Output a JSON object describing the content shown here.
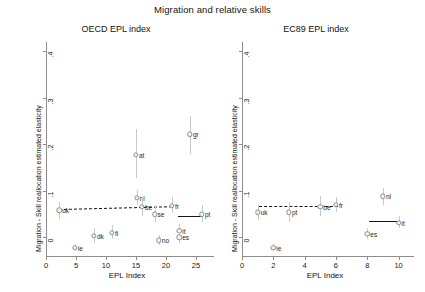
{
  "figure": {
    "title": "Migration and relative skills",
    "y_axis_title": "Migration - Skill reallocation estimated elasticity",
    "x_axis_title": "EPL Index"
  },
  "chart_data": [
    {
      "type": "scatter",
      "title": "OECD EPL index",
      "xlabel": "EPL Index",
      "ylabel": "Migration - Skill reallocation estimated elasticity",
      "xlim": [
        0,
        27
      ],
      "ylim": [
        -0.04,
        0.42
      ],
      "xticks": [
        0,
        5,
        10,
        15,
        20,
        25
      ],
      "xticklabels": [
        "0",
        "5",
        "10",
        "15",
        "20",
        "25"
      ],
      "yticks": [
        0,
        0.1,
        0.2,
        0.3,
        0.4
      ],
      "yticklabels": [
        "0",
        ".1",
        ".2",
        ".3",
        ".4"
      ],
      "grid": false,
      "legend": "none",
      "points": [
        {
          "label": "uk",
          "x": 2.2,
          "y": 0.058,
          "lo": 0.04,
          "hi": 0.076,
          "label_side": "right"
        },
        {
          "label": "ie",
          "x": 4.8,
          "y": -0.022,
          "lo": -0.03,
          "hi": -0.014,
          "label_side": "right"
        },
        {
          "label": "dk",
          "x": 8.0,
          "y": 0.004,
          "lo": -0.012,
          "hi": 0.02,
          "label_side": "right"
        },
        {
          "label": "fi",
          "x": 11.0,
          "y": 0.01,
          "lo": -0.004,
          "hi": 0.026,
          "label_side": "right"
        },
        {
          "label": "at",
          "x": 15.0,
          "y": 0.178,
          "lo": 0.128,
          "hi": 0.232,
          "label_side": "right"
        },
        {
          "label": "nl",
          "x": 15.1,
          "y": 0.085,
          "lo": 0.07,
          "hi": 0.102,
          "label_side": "right"
        },
        {
          "label": "be",
          "x": 16.0,
          "y": 0.066,
          "lo": 0.046,
          "hi": 0.086,
          "label_side": "right"
        },
        {
          "label": "se",
          "x": 18.1,
          "y": 0.05,
          "lo": 0.034,
          "hi": 0.07,
          "label_side": "right"
        },
        {
          "label": "no",
          "x": 18.8,
          "y": -0.006,
          "lo": -0.016,
          "hi": 0.006,
          "label_side": "right"
        },
        {
          "label": "fr",
          "x": 21.0,
          "y": 0.068,
          "lo": 0.052,
          "hi": 0.086,
          "label_side": "right"
        },
        {
          "label": "it",
          "x": 22.2,
          "y": 0.014,
          "lo": 0.002,
          "hi": 0.028,
          "label_side": "right"
        },
        {
          "label": "es",
          "x": 22.2,
          "y": 0.0,
          "lo": -0.012,
          "hi": 0.012,
          "label_side": "right"
        },
        {
          "label": "gr",
          "x": 24.0,
          "y": 0.222,
          "lo": 0.18,
          "hi": 0.262,
          "label_side": "right"
        },
        {
          "label": "pt",
          "x": 26.0,
          "y": 0.05,
          "lo": 0.032,
          "hi": 0.07,
          "label_side": "right"
        }
      ],
      "fit_lines": [
        {
          "style": "dashed",
          "x0": 2.2,
          "x1": 21.0,
          "y0": 0.062,
          "y1": 0.068
        },
        {
          "style": "solid",
          "x0": 22.0,
          "x1": 26.2,
          "y0": 0.046,
          "y1": 0.046
        }
      ]
    },
    {
      "type": "scatter",
      "title": "EC89 EPL index",
      "xlabel": "EPL Index",
      "ylabel": "Migration - Skill reallocation estimated elasticity",
      "xlim": [
        0,
        10.6
      ],
      "ylim": [
        -0.04,
        0.42
      ],
      "xticks": [
        0,
        2,
        4,
        6,
        8,
        10
      ],
      "xticklabels": [
        "0",
        "2",
        "4",
        "6",
        "8",
        "10"
      ],
      "yticks": [
        0,
        0.1,
        0.2,
        0.3,
        0.4
      ],
      "yticklabels": [
        "0",
        ".1",
        ".2",
        ".3",
        ".4"
      ],
      "grid": false,
      "legend": "none",
      "points": [
        {
          "label": "uk",
          "x": 1.0,
          "y": 0.054,
          "lo": 0.038,
          "hi": 0.07,
          "label_side": "right"
        },
        {
          "label": "ie",
          "x": 2.0,
          "y": -0.022,
          "lo": -0.03,
          "hi": -0.014,
          "label_side": "right"
        },
        {
          "label": "pt",
          "x": 3.0,
          "y": 0.054,
          "lo": 0.034,
          "hi": 0.076,
          "label_side": "right"
        },
        {
          "label": "be",
          "x": 5.0,
          "y": 0.066,
          "lo": 0.046,
          "hi": 0.09,
          "label_side": "right"
        },
        {
          "label": "fr",
          "x": 6.0,
          "y": 0.07,
          "lo": 0.054,
          "hi": 0.086,
          "label_side": "right"
        },
        {
          "label": "es",
          "x": 8.0,
          "y": 0.008,
          "lo": -0.004,
          "hi": 0.02,
          "label_side": "right"
        },
        {
          "label": "nl",
          "x": 9.0,
          "y": 0.088,
          "lo": 0.07,
          "hi": 0.106,
          "label_side": "right"
        },
        {
          "label": "it",
          "x": 10.0,
          "y": 0.032,
          "lo": 0.02,
          "hi": 0.046,
          "label_side": "right"
        }
      ],
      "fit_lines": [
        {
          "style": "dashed",
          "x0": 1.1,
          "x1": 6.1,
          "y0": 0.068,
          "y1": 0.068
        },
        {
          "style": "solid",
          "x0": 8.1,
          "x1": 10.1,
          "y0": 0.036,
          "y1": 0.036
        }
      ]
    }
  ]
}
